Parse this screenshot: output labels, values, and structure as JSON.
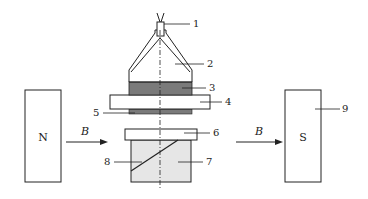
{
  "diagram": {
    "type": "apparatus schematic",
    "magnets": {
      "north": {
        "label": "N"
      },
      "south": {
        "label": "S",
        "callout": "9"
      }
    },
    "field_arrows": [
      {
        "label": "B"
      },
      {
        "label": "B"
      }
    ],
    "callouts": [
      {
        "id": "1",
        "label": "1"
      },
      {
        "id": "2",
        "label": "2"
      },
      {
        "id": "3",
        "label": "3"
      },
      {
        "id": "4",
        "label": "4"
      },
      {
        "id": "5",
        "label": "5"
      },
      {
        "id": "6",
        "label": "6"
      },
      {
        "id": "7",
        "label": "7"
      },
      {
        "id": "8",
        "label": "8"
      },
      {
        "id": "9",
        "label": "9"
      }
    ],
    "colors": {
      "stroke": "#222222",
      "dark_fill": "#7a7a7a",
      "light_fill": "#e6e6e6",
      "background": "#ffffff"
    }
  }
}
